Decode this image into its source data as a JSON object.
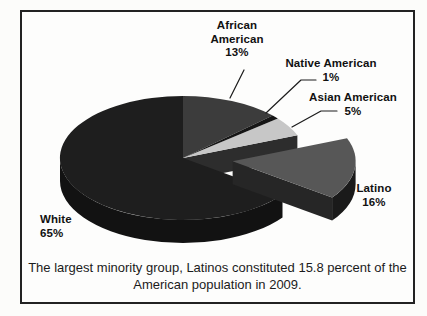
{
  "figure": {
    "caption_lines": [
      "The largest minority group, Latinos constituted 15.8 percent of the",
      "American population in 2009."
    ]
  },
  "chart_data": {
    "type": "pie",
    "style": "3d-exploded",
    "start_angle": "top",
    "direction": "clockwise",
    "title": "",
    "categories": [
      "African American",
      "Native American",
      "Asian American",
      "Latino",
      "White"
    ],
    "values": [
      13,
      1,
      5,
      16,
      65
    ],
    "percent_labels": [
      "13%",
      "1%",
      "5%",
      "16%",
      "65%"
    ],
    "exploded_slice": "Latino",
    "colors": {
      "slices": [
        "#3c3c3c",
        "#161616",
        "#c7c7c7",
        "#575757",
        "#1e1e1e"
      ],
      "main_rim": "#121212",
      "notch_interior": "#2d2d2d",
      "exploded_rim": "#1a1a1a",
      "exploded_cut_face": "#262626",
      "leader_line": "#1c1c1c"
    },
    "caption": "The largest minority group, Latinos constituted 15.8 percent of the American population in 2009."
  }
}
